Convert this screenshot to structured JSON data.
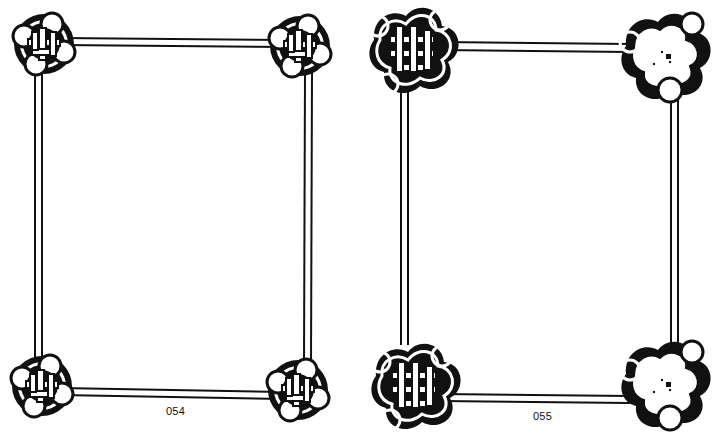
{
  "page": {
    "background": "#ffffff",
    "ink": "#111111"
  },
  "frames": [
    {
      "id": "054",
      "label": "054",
      "style": "circular-knot-corners",
      "bars": {
        "left_x": 34,
        "right_x": 304,
        "top_y": 37,
        "bottom_y": 386,
        "bar_width": 9
      },
      "corners": [
        {
          "pos": "top-left",
          "cx": 44,
          "cy": 42
        },
        {
          "pos": "top-right",
          "cx": 302,
          "cy": 44
        },
        {
          "pos": "bottom-left",
          "cx": 40,
          "cy": 386
        },
        {
          "pos": "bottom-right",
          "cx": 300,
          "cy": 392
        }
      ]
    },
    {
      "id": "055",
      "label": "055",
      "style": "triangular-knot-corners",
      "bars": {
        "left_x": 400,
        "right_x": 670,
        "top_y": 42,
        "bottom_y": 394,
        "bar_width": 9
      },
      "corners": [
        {
          "pos": "top-left",
          "cx": 410,
          "cy": 48
        },
        {
          "pos": "top-right",
          "cx": 660,
          "cy": 52
        },
        {
          "pos": "bottom-left",
          "cx": 412,
          "cy": 388
        },
        {
          "pos": "bottom-right",
          "cx": 660,
          "cy": 386
        }
      ]
    }
  ]
}
